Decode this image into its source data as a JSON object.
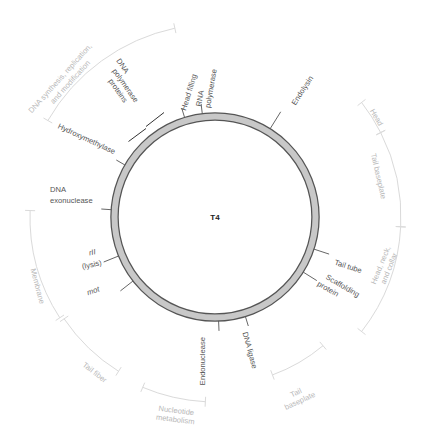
{
  "genome": {
    "name": "T4",
    "center": [
      215,
      217
    ],
    "ring_outer_radius": 104,
    "ring_thickness": 7,
    "ring_fill": "#c8c8c8",
    "ring_stroke": "#555555"
  },
  "genes": [
    {
      "id": "rna-polymerase",
      "label": "RNA polymerase",
      "lines": [
        "RNA",
        "polymerase"
      ],
      "angle": -7
    },
    {
      "id": "head-filling",
      "label": "Head filling",
      "lines": [
        "Head filling"
      ],
      "angle": -17
    },
    {
      "id": "endolysin",
      "label": "Endolysin",
      "lines": [
        "Endolysin"
      ],
      "angle": 32
    },
    {
      "id": "dna-polymerase-proteins",
      "label": "DNA polymerase proteins",
      "lines": [
        "DNA",
        "polymerase",
        "proteins"
      ],
      "angle": -43
    },
    {
      "id": "hydroxymethylase",
      "label": "Hydroxymethylase",
      "lines": [
        "Hydroxymethylase"
      ],
      "angle": -60
    },
    {
      "id": "dna-exonuclease",
      "label": "DNA exonuclease",
      "lines": [
        "DNA",
        "exonuclease"
      ],
      "angle": -86
    },
    {
      "id": "rii-lysis",
      "label": "rII (lysis)",
      "lines": [
        "rII",
        "(lysis)"
      ],
      "angle": -112
    },
    {
      "id": "mot",
      "label": "mot",
      "lines": [
        "mot"
      ],
      "angle": -128
    },
    {
      "id": "endonuclease",
      "label": "Endonuclease",
      "lines": [
        "Endonuclease"
      ],
      "angle": 178
    },
    {
      "id": "dna-ligase",
      "label": "DNA ligase",
      "lines": [
        "DNA ligase"
      ],
      "angle": 163
    },
    {
      "id": "tail-tube",
      "label": "Tail tube",
      "lines": [
        "Tail tube"
      ],
      "angle": 108
    },
    {
      "id": "scaffolding-protein",
      "label": "Scaffolding protein",
      "lines": [
        "Scaffolding",
        "protein"
      ],
      "angle": 122
    }
  ],
  "regions": [
    {
      "id": "dna-synthesis",
      "label": "DNA synthesis, replication, and modification",
      "lines": [
        "DNA synthesis, replication,",
        "and modification"
      ],
      "start": -60,
      "end": -12
    },
    {
      "id": "head",
      "label": "Head",
      "lines": [
        "Head"
      ],
      "start": 52,
      "end": 63
    },
    {
      "id": "tail-baseplate-1",
      "label": "Tail baseplate",
      "lines": [
        "Tail baseplate"
      ],
      "start": 63,
      "end": 93
    },
    {
      "id": "head-neck-collar",
      "label": "Head, neck, and collar",
      "lines": [
        "Head, neck,",
        "and collar"
      ],
      "start": 93,
      "end": 128
    },
    {
      "id": "tail-baseplate-2",
      "label": "Tail baseplate",
      "lines": [
        "Tail",
        "baseplate"
      ],
      "start": 140,
      "end": 160
    },
    {
      "id": "nucleotide-metabolism",
      "label": "Nucleotide metabolism",
      "lines": [
        "Nucleotide",
        "metabolism"
      ],
      "start": 183,
      "end": 203
    },
    {
      "id": "tail-fiber",
      "label": "Tail fiber",
      "lines": [
        "Tail fiber"
      ],
      "start": 212,
      "end": 236
    },
    {
      "id": "membrane",
      "label": "Membrane",
      "lines": [
        "Membrane"
      ],
      "start": 237,
      "end": 272
    }
  ]
}
